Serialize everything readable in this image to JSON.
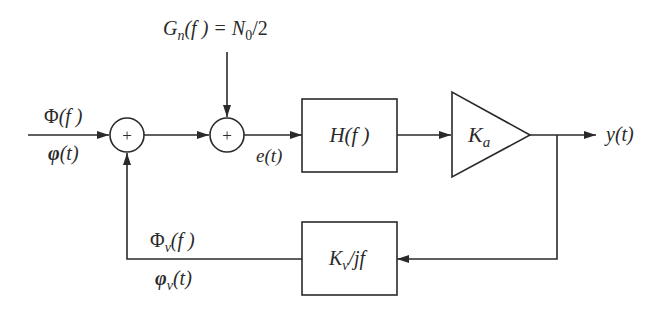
{
  "diagram": {
    "title": "",
    "type": "block-diagram",
    "nodes": [
      {
        "id": "input",
        "label_top": "Φ(f)",
        "label_bottom": "φ(t)"
      },
      {
        "id": "sum1",
        "symbol": "+"
      },
      {
        "id": "sum2",
        "symbol": "+"
      },
      {
        "id": "noise",
        "label": "Gn(f) = N0/2"
      },
      {
        "id": "filter",
        "label": "H(f)"
      },
      {
        "id": "amplifier",
        "label": "Ka"
      },
      {
        "id": "output",
        "label": "y(t)"
      },
      {
        "id": "vco",
        "label": "Kv/jf"
      },
      {
        "id": "feedback",
        "label_top": "Φv(f)",
        "label_bottom": "φv(t)"
      },
      {
        "id": "error",
        "label": "e(t)"
      }
    ],
    "edges": [
      {
        "from": "input",
        "to": "sum1"
      },
      {
        "from": "sum1",
        "to": "sum2"
      },
      {
        "from": "noise",
        "to": "sum2"
      },
      {
        "from": "sum2",
        "to": "filter",
        "label": "e(t)"
      },
      {
        "from": "filter",
        "to": "amplifier"
      },
      {
        "from": "amplifier",
        "to": "output"
      },
      {
        "from": "amplifier",
        "to": "vco"
      },
      {
        "from": "vco",
        "to": "sum1"
      }
    ]
  },
  "labels": {
    "input_freq_main": "Φ",
    "input_freq_arg": "(f )",
    "input_time_main": "φ",
    "input_time_arg": "(t)",
    "sum_symbol": "+",
    "noise_G": "G",
    "noise_sub": "n",
    "noise_rest": "(f ) = ",
    "noise_N": "N",
    "noise_N_sub": "0",
    "noise_tail": "/2",
    "error_label": "e(t)",
    "filter_H": "H",
    "filter_arg": "(f )",
    "amp_K": "K",
    "amp_sub": "a",
    "output_label": "y(t)",
    "vco_K": "K",
    "vco_sub": "v",
    "vco_tail": "/jf",
    "fb_freq_main": "Φ",
    "fb_freq_sub": "v",
    "fb_freq_arg": "(f )",
    "fb_time_main": "φ",
    "fb_time_sub": "v",
    "fb_time_arg": "(t)"
  }
}
